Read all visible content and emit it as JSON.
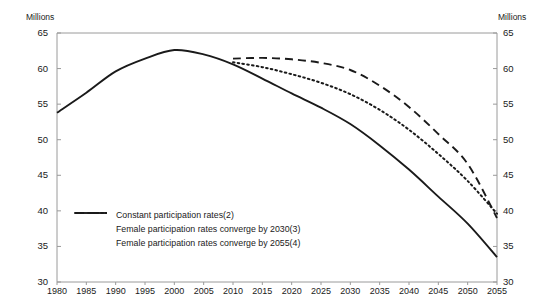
{
  "chart_data": {
    "type": "line",
    "title": "",
    "xlabel": "",
    "ylabel": "Millions",
    "unit_left": "Millions",
    "unit_right": "Millions",
    "xlim": [
      1980,
      2055
    ],
    "ylim": [
      30,
      65
    ],
    "ytick_step": 5,
    "xtick_step": 5,
    "grid": false,
    "legend_position": "inside-lower-left",
    "x": [
      1980,
      1985,
      1990,
      1995,
      2000,
      2005,
      2010,
      2015,
      2020,
      2025,
      2030,
      2035,
      2040,
      2045,
      2050,
      2055
    ],
    "yticks": [
      65,
      60,
      55,
      50,
      45,
      40,
      35,
      30
    ],
    "xticks": [
      1980,
      1985,
      1990,
      1995,
      2000,
      2005,
      2010,
      2015,
      2020,
      2025,
      2030,
      2035,
      2040,
      2045,
      2050,
      2055
    ],
    "series": [
      {
        "name": "Constant participation rates(2)",
        "style": "solid",
        "color": "#1a1a1a",
        "values": [
          53.8,
          56.6,
          59.6,
          61.4,
          62.6,
          62.0,
          60.6,
          58.6,
          56.5,
          54.5,
          52.2,
          49.2,
          45.8,
          42.0,
          38.2,
          33.5
        ]
      },
      {
        "name": "Female participation rates converge by 2030(3)",
        "style": "dashed",
        "color": "#1a1a1a",
        "values": [
          null,
          null,
          null,
          null,
          null,
          null,
          61.4,
          61.5,
          61.3,
          60.8,
          59.8,
          57.6,
          54.6,
          50.8,
          46.6,
          39.0
        ]
      },
      {
        "name": "Female participation rates converge by 2055(4)",
        "style": "dotted",
        "color": "#1a1a1a",
        "values": [
          null,
          null,
          null,
          null,
          null,
          null,
          60.9,
          60.2,
          59.2,
          58.0,
          56.4,
          54.2,
          51.4,
          48.0,
          44.2,
          39.6
        ]
      }
    ]
  }
}
